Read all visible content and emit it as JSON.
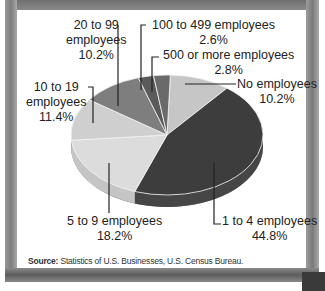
{
  "chart_data": {
    "type": "pie",
    "title": "",
    "categories": [
      "No employees",
      "1 to 4 employees",
      "5 to 9 employees",
      "10 to 19 employees",
      "20 to 99 employees",
      "100 to 499 employees",
      "500 or more employees"
    ],
    "values": [
      10.2,
      44.8,
      18.2,
      11.4,
      10.2,
      2.6,
      2.8
    ],
    "colors": [
      "#c6c6c6",
      "#3d3d3d",
      "#dcdcdc",
      "#cfcfcf",
      "#7e7e7e",
      "#5a5a5a",
      "#6a6a6a"
    ],
    "legend": "none (direct labels)",
    "labels": [
      {
        "line1": "No employees",
        "line2": "10.2%"
      },
      {
        "line1": "1 to 4 employees",
        "line2": "44.8%"
      },
      {
        "line1": "5 to 9 employees",
        "line2": "18.2%"
      },
      {
        "line1": "10 to 19",
        "line2": "employees",
        "line3": "11.4%"
      },
      {
        "line1": "20 to 99",
        "line2": "employees",
        "line3": "10.2%"
      },
      {
        "line1": "100 to 499 employees",
        "line2": "2.6%"
      },
      {
        "line1": "500 or more employees",
        "line2": "2.8%"
      }
    ]
  },
  "source": {
    "label": "Source:",
    "text": " Statistics of U.S. Businesses, U.S. Census Bureau."
  }
}
